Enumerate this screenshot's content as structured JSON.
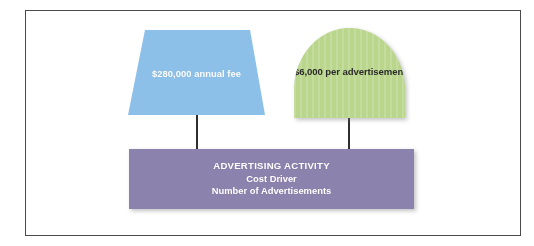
{
  "diagram": {
    "type": "cost-behavior-activity-diagram",
    "frame": {
      "border_color": "#4a4a4a"
    },
    "fixed_cost": {
      "label": "$280,000 annual fee",
      "shape": "trapezoid",
      "fill_color": "#8cc0e8",
      "text_color": "#ffffff"
    },
    "variable_cost": {
      "label": "$6,000 per advertisement",
      "shape": "arch",
      "fill_color": "#b9d68c",
      "text_color": "#2b2b2b"
    },
    "activity": {
      "title": "ADVERTISING ACTIVITY",
      "driver_label": "Cost Driver",
      "driver_value": "Number of Advertisements",
      "fill_color": "#8b82ad",
      "text_color": "#ffffff"
    },
    "connectors": {
      "color": "#2e2e2e",
      "left_name": "fixed-cost-to-activity",
      "right_name": "variable-cost-to-activity"
    }
  }
}
